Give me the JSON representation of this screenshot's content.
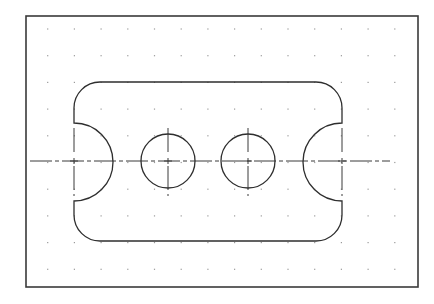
{
  "drawing": {
    "title": "Plate with two holes and semicircular end notches",
    "canvas": {
      "width": 434,
      "height": 304,
      "background": "#ffffff"
    },
    "colors": {
      "border": "#3a3a3a",
      "outline": "#2e2e2e",
      "centerline": "#3a3a3a",
      "grid_dot": "#9a9a9a"
    },
    "border": {
      "x": 26,
      "y": 16,
      "width": 392,
      "height": 271
    },
    "grid": {
      "x_start": 47.7,
      "y_start": 29,
      "spacing": 26.7,
      "columns": 14,
      "rows": 10
    },
    "plate": {
      "left": 74,
      "right": 342,
      "top": 82,
      "bottom": 241,
      "corner_radius": 26,
      "notch_center_y": 162,
      "notch_radius": 39
    },
    "holes": [
      {
        "cx": 168,
        "cy": 161,
        "r": 27
      },
      {
        "cx": 248,
        "cy": 161,
        "r": 27
      }
    ],
    "centerlines": {
      "horizontal": {
        "x1": 30,
        "x2": 390,
        "y": 161
      },
      "verticals": [
        {
          "x": 74,
          "y1": 128,
          "y2": 196
        },
        {
          "x": 168,
          "y1": 128,
          "y2": 196
        },
        {
          "x": 248,
          "y1": 128,
          "y2": 196
        },
        {
          "x": 342,
          "y1": 128,
          "y2": 196
        }
      ],
      "dash_pattern": "22 3 4 3"
    }
  }
}
